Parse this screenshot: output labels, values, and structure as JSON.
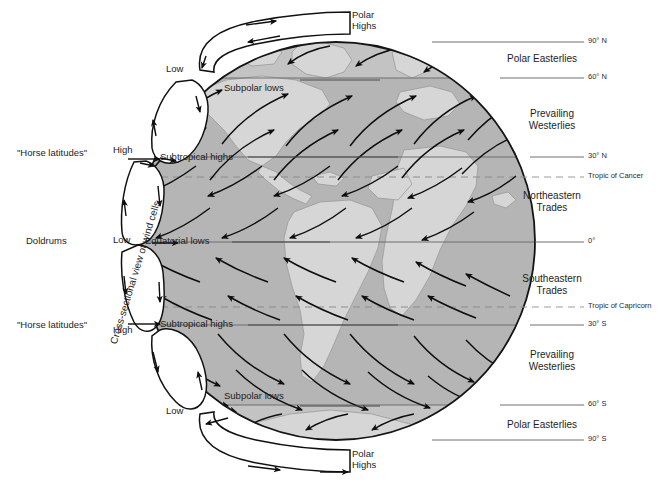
{
  "diagram": {
    "type": "earth-wind-cells",
    "colors": {
      "ocean": "#b5b5b5",
      "land": "#d4d4d4",
      "polar_band": "#c2c2c2",
      "outline": "#141414",
      "latitude_line": "#6b6b6b",
      "tropic_line": "#8e8e8e",
      "text": "#1d1d1d",
      "background": "#ffffff"
    },
    "geometry": {
      "globe_center_x": 336,
      "globe_center_y": 241,
      "globe_radius": 199
    }
  },
  "rotated_caption": "Cross-sectional view of wind cells",
  "pressure_labels": [
    {
      "name": "polar-high-north",
      "text_line1": "Polar",
      "text_line2": "Highs",
      "x": 338,
      "y": 8
    },
    {
      "name": "low-north-subpolar",
      "text": "Low",
      "x": 170,
      "y": 66
    },
    {
      "name": "high-north-subtropical",
      "text": "High",
      "x": 114,
      "y": 146
    },
    {
      "name": "low-equatorial",
      "text": "Low",
      "x": 114,
      "y": 235
    },
    {
      "name": "high-south-subtropical",
      "text": "High",
      "x": 114,
      "y": 326
    },
    {
      "name": "low-south-subpolar",
      "text": "Low",
      "x": 170,
      "y": 408
    },
    {
      "name": "polar-high-south",
      "text_line1": "Polar",
      "text_line2": "Highs",
      "x": 338,
      "y": 450
    }
  ],
  "left_labels": [
    {
      "name": "horse-latitudes-north",
      "text": "\"Horse latitudes\"",
      "x": 18,
      "y": 148
    },
    {
      "name": "doldrums",
      "text": "Doldrums",
      "x": 26,
      "y": 237
    },
    {
      "name": "horse-latitudes-south",
      "text": "\"Horse latitudes\"",
      "x": 18,
      "y": 320
    }
  ],
  "pressure_belts_on_globe": [
    {
      "name": "subpolar-lows-north",
      "text": "Subpolar lows",
      "x": 224,
      "y": 84
    },
    {
      "name": "subtropical-highs-north",
      "text": "Subtropical highs",
      "x": 160,
      "y": 153
    },
    {
      "name": "equatorial-lows",
      "text": "Equatorial lows",
      "x": 146,
      "y": 237
    },
    {
      "name": "subtropical-highs-south",
      "text": "Subtropical highs",
      "x": 160,
      "y": 320
    },
    {
      "name": "subpolar-lows-south",
      "text": "Subpolar lows",
      "x": 224,
      "y": 392
    }
  ],
  "wind_belt_labels": [
    {
      "name": "polar-easterlies-north",
      "lines": [
        "Polar Easterlies"
      ],
      "x": 540,
      "y": 55
    },
    {
      "name": "prevailing-westerlies-north",
      "lines": [
        "Prevailing",
        "Westerlies"
      ],
      "x": 555,
      "y": 109
    },
    {
      "name": "northeastern-trades",
      "lines": [
        "Northeastern",
        "Trades"
      ],
      "x": 555,
      "y": 190
    },
    {
      "name": "southeastern-trades",
      "lines": [
        "Southeastern",
        "Trades"
      ],
      "x": 555,
      "y": 275
    },
    {
      "name": "prevailing-westerlies-south",
      "lines": [
        "Prevailing",
        "Westerlies"
      ],
      "x": 555,
      "y": 350
    },
    {
      "name": "polar-easterlies-south",
      "lines": [
        "Polar Easterlies"
      ],
      "x": 540,
      "y": 421
    }
  ],
  "latitude_lines": [
    {
      "name": "lat-90n",
      "label": "90° N",
      "y": 42,
      "style": "solid",
      "label_x": 588
    },
    {
      "name": "lat-60n",
      "label": "60° N",
      "y": 78,
      "style": "solid",
      "label_x": 588
    },
    {
      "name": "lat-30n",
      "label": "30° N",
      "y": 157,
      "style": "solid",
      "label_x": 588
    },
    {
      "name": "tropic-of-cancer",
      "label": "Tropic of Cancer",
      "y": 177,
      "style": "dashed",
      "label_x": 588
    },
    {
      "name": "lat-0",
      "label": "0°",
      "y": 242,
      "style": "solid",
      "label_x": 588
    },
    {
      "name": "tropic-of-capricorn",
      "label": "Tropic of Capricorn",
      "y": 307,
      "style": "dashed",
      "label_x": 588
    },
    {
      "name": "lat-30s",
      "label": "30° S",
      "y": 325,
      "style": "solid",
      "label_x": 588
    },
    {
      "name": "lat-60s",
      "label": "60° S",
      "y": 405,
      "style": "solid",
      "label_x": 588
    },
    {
      "name": "lat-90s",
      "label": "90° S",
      "y": 440,
      "style": "solid",
      "label_x": 588
    }
  ],
  "wind_cells": [
    {
      "name": "polar-cell-north",
      "hemisphere": "N",
      "type": "polar"
    },
    {
      "name": "ferrel-cell-north",
      "hemisphere": "N",
      "type": "ferrel"
    },
    {
      "name": "hadley-cell-north",
      "hemisphere": "N",
      "type": "hadley"
    },
    {
      "name": "hadley-cell-south",
      "hemisphere": "S",
      "type": "hadley"
    },
    {
      "name": "ferrel-cell-south",
      "hemisphere": "S",
      "type": "ferrel"
    },
    {
      "name": "polar-cell-south",
      "hemisphere": "S",
      "type": "polar"
    }
  ]
}
